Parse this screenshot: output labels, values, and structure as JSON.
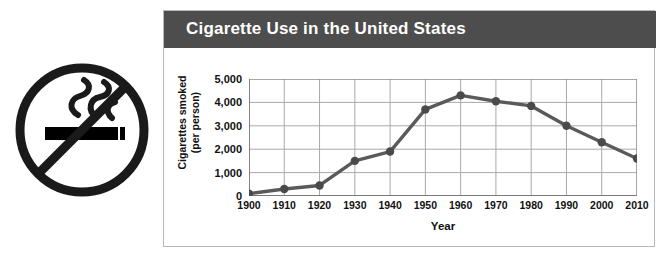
{
  "figure": {
    "title": "Cigarette Use in the United States",
    "header_color": "#4d4d4d",
    "panel_border_color": "#b8b8b8",
    "background": "#ffffff"
  },
  "icon": {
    "name": "no-smoking-icon",
    "ring_color": "#1a1a1a",
    "slash_color": "#1a1a1a",
    "cigarette_color": "#000000",
    "smoke_color": "#1a1a1a"
  },
  "chart_data": {
    "type": "line",
    "title": "Cigarette Use in the United States",
    "xlabel": "Year",
    "ylabel": "Cigarettes smoked (per person)",
    "ylabel_lines": [
      "Cigarettes smoked",
      "(per person)"
    ],
    "categories": [
      1900,
      1910,
      1920,
      1930,
      1940,
      1950,
      1960,
      1970,
      1980,
      1990,
      2000,
      2010
    ],
    "x_tick_labels": [
      "1900",
      "1910",
      "1920",
      "1930",
      "1940",
      "1950",
      "1960",
      "1970",
      "1980",
      "1990",
      "2000",
      "2010"
    ],
    "values": [
      100,
      300,
      450,
      1500,
      1900,
      3700,
      4300,
      4050,
      3850,
      3000,
      2300,
      1600
    ],
    "y_ticks": [
      0,
      1000,
      2000,
      3000,
      4000,
      5000
    ],
    "y_tick_labels": [
      "0",
      "1,000",
      "2,000",
      "3,000",
      "4,000",
      "5,000"
    ],
    "ylim": [
      0,
      5000
    ],
    "xlim": [
      1900,
      2010
    ],
    "grid": true,
    "legend": false,
    "line_color": "#5a5a5a",
    "marker_color": "#4a4a4a",
    "grid_color": "#a9a9a9",
    "axis_color": "#7a7a7a"
  }
}
